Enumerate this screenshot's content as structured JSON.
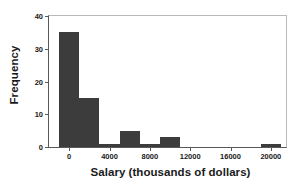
{
  "chart_data": {
    "type": "bar",
    "subtype": "histogram",
    "title": "",
    "xlabel": "Salary (thousands of dollars)",
    "ylabel": "Frequency",
    "xlim": [
      -2000,
      21500
    ],
    "ylim": [
      0,
      40
    ],
    "grid": false,
    "legend": null,
    "bar_color": "#3c3c3c",
    "frame_color": "#b9b9b9",
    "axis_color": "#595959",
    "text_color": "#1a1a1a",
    "bin_width": 2000,
    "xticks": [
      {
        "value": 0,
        "label": "0"
      },
      {
        "value": 4000,
        "label": "4000"
      },
      {
        "value": 8000,
        "label": "8000"
      },
      {
        "value": 12000,
        "label": "12000"
      },
      {
        "value": 16000,
        "label": "16000"
      },
      {
        "value": 20000,
        "label": "20000"
      }
    ],
    "yticks": [
      {
        "value": 0,
        "label": "0"
      },
      {
        "value": 10,
        "label": "10"
      },
      {
        "value": 20,
        "label": "20"
      },
      {
        "value": 30,
        "label": "30"
      },
      {
        "value": 40,
        "label": "40"
      }
    ],
    "bins": [
      {
        "x0": -1000,
        "x1": 1000,
        "value": 35
      },
      {
        "x0": 1000,
        "x1": 3000,
        "value": 15
      },
      {
        "x0": 3000,
        "x1": 5000,
        "value": 1
      },
      {
        "x0": 5000,
        "x1": 7000,
        "value": 5
      },
      {
        "x0": 7000,
        "x1": 9000,
        "value": 1
      },
      {
        "x0": 9000,
        "x1": 11000,
        "value": 3
      },
      {
        "x0": 19000,
        "x1": 21000,
        "value": 1
      }
    ],
    "categories": [
      "-1000 to 1000",
      "1000 to 3000",
      "3000 to 5000",
      "5000 to 7000",
      "7000 to 9000",
      "9000 to 11000",
      "19000 to 21000"
    ],
    "values": [
      35,
      15,
      1,
      5,
      1,
      3,
      1
    ]
  }
}
